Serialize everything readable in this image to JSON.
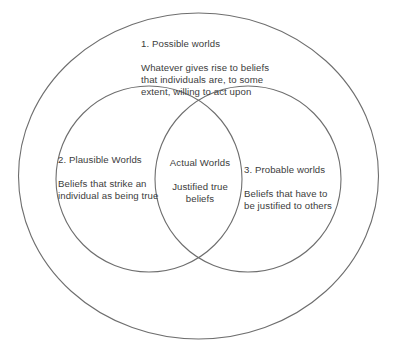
{
  "diagram": {
    "type": "venn",
    "kind": "three-region-nested-venn",
    "background_color": "#ffffff",
    "stroke_color": "#6e6e6e",
    "text_color": "#3c3c3c",
    "regions": [
      {
        "id": "possible",
        "shape": "outer-ellipse",
        "title": "1. Possible worlds",
        "body": "Whatever gives rise to beliefs\nthat individuals are, to some\nextent, willing to act upon"
      },
      {
        "id": "plausible",
        "shape": "left-circle",
        "title": "2. Plausible Worlds",
        "body": "Beliefs that strike an\nindividual as being true"
      },
      {
        "id": "actual",
        "shape": "intersection-lens",
        "title": "Actual Worlds",
        "body": "Justified true\nbeliefs"
      },
      {
        "id": "probable",
        "shape": "right-circle",
        "title": "3. Probable worlds",
        "body": "Beliefs that have to\nbe justified to others"
      }
    ]
  }
}
